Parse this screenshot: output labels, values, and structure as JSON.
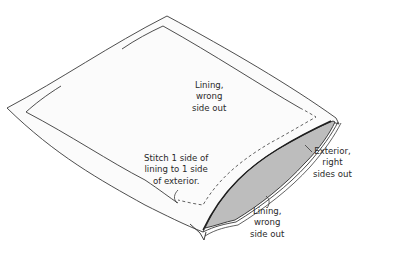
{
  "diagram": {
    "type": "sewing-instruction-illustration",
    "colors": {
      "background": "#ffffff",
      "fabric": "#fbfbfb",
      "outline": "#3a3a3a",
      "exterior_fill": "#bdbdbd",
      "text": "#2a2a2a"
    },
    "labels": {
      "lining_top": {
        "line1": "Lining,",
        "line2": "wrong",
        "line3": "side out"
      },
      "stitch_note": {
        "line1": "Stitch 1 side of",
        "line2": "lining to 1 side",
        "line3": "of exterior."
      },
      "exterior": {
        "line1": "Exterior,",
        "line2": "right",
        "line3": "sides out"
      },
      "lining_bottom": {
        "line1": "Lining,",
        "line2": "wrong",
        "line3": "side out"
      }
    }
  }
}
